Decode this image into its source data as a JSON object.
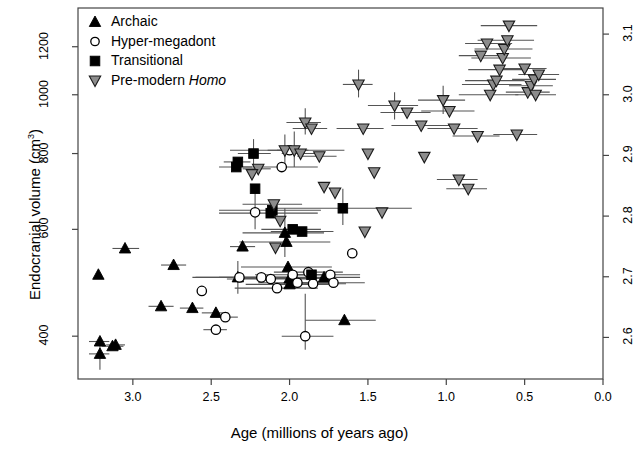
{
  "chart_data": {
    "type": "scatter",
    "title": "",
    "xlabel": "Age (millions of years ago)",
    "ylabel_left": "Endocranial volume (cm3)",
    "ylabel_left_base": "Endocranial volume (cm",
    "ylabel_left_sup": "3",
    "ylabel_left_close": ")",
    "ylabel_right": "",
    "xlim": [
      3.35,
      0.0
    ],
    "xlim_reversed": true,
    "ylim_left": [
      340,
      1390
    ],
    "y_scale": "log10",
    "grid": false,
    "legend_position": "top-left",
    "xticks": [
      "3.0",
      "2.5",
      "2.0",
      "1.5",
      "1.0",
      "0.5",
      "0.0"
    ],
    "xtick_values": [
      3.0,
      2.5,
      2.0,
      1.5,
      1.0,
      0.5,
      0.0
    ],
    "yticks_left": [
      "400",
      "600",
      "800",
      "1000",
      "1200"
    ],
    "ytick_values_left": [
      400,
      600,
      800,
      1000,
      1200
    ],
    "yticks_right": [
      "2.6",
      "2.7",
      "2.8",
      "2.9",
      "3.0",
      "3.1"
    ],
    "ytick_values_right": [
      2.6,
      2.7,
      2.8,
      2.9,
      3.0,
      3.1
    ],
    "series": [
      {
        "name": "Archaic",
        "marker": "triangle-up",
        "fill": "#000000",
        "stroke": "#000000",
        "points": [
          {
            "x": 3.21,
            "y": 374,
            "xerr": [
              3.28,
              3.15
            ],
            "yerr": [
              352,
              398
            ]
          },
          {
            "x": 3.21,
            "y": 392,
            "xerr": [
              3.28,
              3.15
            ],
            "yerr": null
          },
          {
            "x": 3.13,
            "y": 385,
            "xerr": [
              3.2,
              3.06
            ],
            "yerr": null
          },
          {
            "x": 3.11,
            "y": 387,
            "xerr": [
              3.17,
              3.05
            ],
            "yerr": null
          },
          {
            "x": 3.22,
            "y": 505,
            "xerr": null,
            "yerr": null
          },
          {
            "x": 3.05,
            "y": 558,
            "xerr": [
              3.13,
              2.96
            ],
            "yerr": null
          },
          {
            "x": 2.82,
            "y": 448,
            "xerr": [
              2.9,
              2.74
            ],
            "yerr": null
          },
          {
            "x": 2.74,
            "y": 524,
            "xerr": [
              2.82,
              2.66
            ],
            "yerr": null
          },
          {
            "x": 2.62,
            "y": 445,
            "xerr": [
              2.7,
              2.55
            ],
            "yerr": null
          },
          {
            "x": 2.47,
            "y": 437,
            "xerr": [
              2.56,
              2.39
            ],
            "yerr": null
          },
          {
            "x": 2.33,
            "y": 500,
            "xerr": [
              2.62,
              2.05
            ],
            "yerr": [
              470,
              532
            ]
          },
          {
            "x": 2.3,
            "y": 562,
            "xerr": [
              2.38,
              2.22
            ],
            "yerr": null
          },
          {
            "x": 2.03,
            "y": 592,
            "xerr": [
              2.3,
              1.78
            ],
            "yerr": [
              540,
              650
            ]
          },
          {
            "x": 2.02,
            "y": 572,
            "xerr": [
              2.32,
              1.74
            ],
            "yerr": null
          },
          {
            "x": 2.01,
            "y": 520,
            "xerr": [
              2.31,
              1.73
            ],
            "yerr": null
          },
          {
            "x": 2.0,
            "y": 498,
            "xerr": [
              2.3,
              1.72
            ],
            "yerr": null
          },
          {
            "x": 2.0,
            "y": 487,
            "xerr": [
              2.28,
              1.75
            ],
            "yerr": null
          },
          {
            "x": 1.78,
            "y": 500,
            "xerr": [
              2.05,
              1.55
            ],
            "yerr": null
          },
          {
            "x": 1.65,
            "y": 425,
            "xerr": [
              1.9,
              1.45
            ],
            "yerr": null
          }
        ]
      },
      {
        "name": "Hyper-megadont",
        "marker": "circle-open",
        "fill": "#ffffff",
        "stroke": "#000000",
        "points": [
          {
            "x": 2.56,
            "y": 475,
            "xerr": null,
            "yerr": null
          },
          {
            "x": 2.47,
            "y": 410,
            "xerr": [
              2.55,
              2.4
            ],
            "yerr": null
          },
          {
            "x": 2.41,
            "y": 430,
            "xerr": [
              2.5,
              2.33
            ],
            "yerr": null
          },
          {
            "x": 2.0,
            "y": 810,
            "xerr": [
              2.38,
              1.65
            ],
            "yerr": null
          },
          {
            "x": 2.05,
            "y": 760,
            "xerr": [
              2.3,
              1.82
            ],
            "yerr": null
          },
          {
            "x": 2.22,
            "y": 640,
            "xerr": null,
            "yerr": [
              600,
              690
            ]
          },
          {
            "x": 2.18,
            "y": 500,
            "xerr": [
              2.45,
              1.95
            ],
            "yerr": null
          },
          {
            "x": 2.12,
            "y": 497,
            "xerr": [
              2.4,
              1.86
            ],
            "yerr": null
          },
          {
            "x": 2.08,
            "y": 480,
            "xerr": [
              2.35,
              1.82
            ],
            "yerr": null
          },
          {
            "x": 1.98,
            "y": 505,
            "xerr": [
              2.22,
              1.76
            ],
            "yerr": null
          },
          {
            "x": 1.95,
            "y": 490,
            "xerr": [
              2.2,
              1.72
            ],
            "yerr": null
          },
          {
            "x": 1.88,
            "y": 510,
            "xerr": [
              2.1,
              1.66
            ],
            "yerr": null
          },
          {
            "x": 1.85,
            "y": 488,
            "xerr": [
              2.08,
              1.64
            ],
            "yerr": null
          },
          {
            "x": 1.74,
            "y": 505,
            "xerr": [
              1.95,
              1.55
            ],
            "yerr": null
          },
          {
            "x": 1.72,
            "y": 490,
            "xerr": [
              1.92,
              1.52
            ],
            "yerr": null
          },
          {
            "x": 1.9,
            "y": 400,
            "xerr": [
              2.05,
              1.72
            ],
            "yerr": [
              380,
              470
            ]
          },
          {
            "x": 1.6,
            "y": 548,
            "xerr": null,
            "yerr": null
          },
          {
            "x": 2.32,
            "y": 500,
            "xerr": [
              2.6,
              2.02
            ],
            "yerr": null
          }
        ]
      },
      {
        "name": "Transitional",
        "marker": "square-filled",
        "fill": "#000000",
        "stroke": "#000000",
        "points": [
          {
            "x": 2.33,
            "y": 775,
            "xerr": [
              2.42,
              2.25
            ],
            "yerr": null
          },
          {
            "x": 2.34,
            "y": 760,
            "xerr": [
              2.45,
              2.24
            ],
            "yerr": null
          },
          {
            "x": 2.23,
            "y": 800,
            "xerr": [
              2.33,
              2.12
            ],
            "yerr": [
              760,
              845
            ]
          },
          {
            "x": 2.22,
            "y": 700,
            "xerr": null,
            "yerr": null
          },
          {
            "x": 2.11,
            "y": 645,
            "xerr": [
              2.45,
              1.8
            ],
            "yerr": null
          },
          {
            "x": 2.12,
            "y": 638,
            "xerr": [
              2.45,
              1.82
            ],
            "yerr": null
          },
          {
            "x": 1.98,
            "y": 600,
            "xerr": [
              2.18,
              1.8
            ],
            "yerr": null
          },
          {
            "x": 1.92,
            "y": 595,
            "xerr": [
              2.12,
              1.72
            ],
            "yerr": null
          },
          {
            "x": 1.66,
            "y": 650,
            "xerr": [
              2.1,
              1.22
            ],
            "yerr": [
              610,
              700
            ]
          },
          {
            "x": 1.86,
            "y": 505,
            "xerr": [
              1.98,
              1.74
            ],
            "yerr": null
          }
        ]
      },
      {
        "name": "Pre-modern Homo",
        "marker": "triangle-down",
        "fill": "#8c8c8c",
        "stroke": "#1a1a1a",
        "points": [
          {
            "x": 2.2,
            "y": 755,
            "xerr": [
              2.3,
              2.12
            ],
            "yerr": null
          },
          {
            "x": 2.24,
            "y": 740,
            "xerr": null,
            "yerr": null
          },
          {
            "x": 2.1,
            "y": 660,
            "xerr": [
              2.3,
              1.92
            ],
            "yerr": null
          },
          {
            "x": 2.06,
            "y": 620,
            "xerr": null,
            "yerr": null
          },
          {
            "x": 2.09,
            "y": 560,
            "xerr": null,
            "yerr": null
          },
          {
            "x": 2.03,
            "y": 810,
            "xerr": [
              2.14,
              1.94
            ],
            "yerr": [
              770,
              860
            ]
          },
          {
            "x": 1.97,
            "y": 810,
            "xerr": [
              2.08,
              1.88
            ],
            "yerr": [
              760,
              870
            ]
          },
          {
            "x": 1.93,
            "y": 800,
            "xerr": [
              2.05,
              1.84
            ],
            "yerr": null
          },
          {
            "x": 1.9,
            "y": 900,
            "xerr": [
              2.02,
              1.8
            ],
            "yerr": [
              860,
              950
            ]
          },
          {
            "x": 1.86,
            "y": 880,
            "xerr": [
              1.98,
              1.76
            ],
            "yerr": null
          },
          {
            "x": 1.81,
            "y": 792,
            "xerr": [
              1.95,
              1.7
            ],
            "yerr": null
          },
          {
            "x": 1.78,
            "y": 705,
            "xerr": null,
            "yerr": null
          },
          {
            "x": 1.71,
            "y": 690,
            "xerr": null,
            "yerr": null
          },
          {
            "x": 1.56,
            "y": 1040,
            "xerr": [
              1.66,
              1.47
            ],
            "yerr": [
              990,
              1100
            ]
          },
          {
            "x": 1.53,
            "y": 880,
            "xerr": [
              1.7,
              1.4
            ],
            "yerr": null
          },
          {
            "x": 1.5,
            "y": 800,
            "xerr": null,
            "yerr": null
          },
          {
            "x": 1.46,
            "y": 745,
            "xerr": null,
            "yerr": null
          },
          {
            "x": 1.33,
            "y": 960,
            "xerr": [
              1.5,
              1.18
            ],
            "yerr": [
              910,
              1010
            ]
          },
          {
            "x": 1.25,
            "y": 935,
            "xerr": [
              1.42,
              1.1
            ],
            "yerr": null
          },
          {
            "x": 1.16,
            "y": 890,
            "xerr": [
              1.35,
              0.98
            ],
            "yerr": null
          },
          {
            "x": 1.14,
            "y": 790,
            "xerr": null,
            "yerr": null
          },
          {
            "x": 1.02,
            "y": 980,
            "xerr": [
              1.18,
              0.88
            ],
            "yerr": [
              930,
              1035
            ]
          },
          {
            "x": 0.98,
            "y": 940,
            "xerr": [
              1.16,
              0.82
            ],
            "yerr": null
          },
          {
            "x": 0.95,
            "y": 880,
            "xerr": [
              1.12,
              0.8
            ],
            "yerr": null
          },
          {
            "x": 0.92,
            "y": 725,
            "xerr": [
              1.06,
              0.8
            ],
            "yerr": null
          },
          {
            "x": 0.86,
            "y": 700,
            "xerr": [
              1.0,
              0.74
            ],
            "yerr": null
          },
          {
            "x": 0.8,
            "y": 855,
            "xerr": [
              0.96,
              0.66
            ],
            "yerr": null
          },
          {
            "x": 0.72,
            "y": 1000,
            "xerr": [
              0.92,
              0.54
            ],
            "yerr": null
          },
          {
            "x": 0.7,
            "y": 1040,
            "xerr": [
              0.9,
              0.52
            ],
            "yerr": null
          },
          {
            "x": 0.68,
            "y": 1055,
            "xerr": [
              0.88,
              0.5
            ],
            "yerr": null
          },
          {
            "x": 0.66,
            "y": 1100,
            "xerr": [
              0.86,
              0.48
            ],
            "yerr": null
          },
          {
            "x": 0.64,
            "y": 1150,
            "xerr": [
              0.84,
              0.46
            ],
            "yerr": null
          },
          {
            "x": 0.63,
            "y": 1190,
            "xerr": [
              0.82,
              0.45
            ],
            "yerr": null
          },
          {
            "x": 0.61,
            "y": 1230,
            "xerr": [
              0.8,
              0.44
            ],
            "yerr": null
          },
          {
            "x": 0.6,
            "y": 1300,
            "xerr": [
              0.78,
              0.42
            ],
            "yerr": null
          },
          {
            "x": 0.74,
            "y": 1215,
            "xerr": [
              0.88,
              0.58
            ],
            "yerr": null
          },
          {
            "x": 0.78,
            "y": 1160,
            "xerr": [
              0.92,
              0.62
            ],
            "yerr": null
          },
          {
            "x": 0.5,
            "y": 1105,
            "xerr": [
              0.66,
              0.36
            ],
            "yerr": null
          },
          {
            "x": 0.48,
            "y": 1010,
            "xerr": [
              0.62,
              0.34
            ],
            "yerr": null
          },
          {
            "x": 0.46,
            "y": 1035,
            "xerr": [
              0.6,
              0.32
            ],
            "yerr": null
          },
          {
            "x": 0.44,
            "y": 1060,
            "xerr": [
              0.58,
              0.3
            ],
            "yerr": null
          },
          {
            "x": 0.43,
            "y": 1000,
            "xerr": [
              0.56,
              0.3
            ],
            "yerr": null
          },
          {
            "x": 0.41,
            "y": 1080,
            "xerr": [
              0.54,
              0.28
            ],
            "yerr": null
          },
          {
            "x": 1.41,
            "y": 640,
            "xerr": null,
            "yerr": null
          },
          {
            "x": 1.52,
            "y": 595,
            "xerr": null,
            "yerr": null
          },
          {
            "x": 0.55,
            "y": 860,
            "xerr": [
              0.7,
              0.42
            ],
            "yerr": null
          }
        ]
      }
    ],
    "legend": [
      {
        "label": "Archaic",
        "marker": "triangle-up",
        "fill": "#000000"
      },
      {
        "label": "Hyper-megadont",
        "marker": "circle-open",
        "fill": "#ffffff"
      },
      {
        "label": "Transitional",
        "marker": "square-filled",
        "fill": "#000000"
      },
      {
        "label": "Pre-modern Homo",
        "marker": "triangle-down",
        "fill": "#8c8c8c",
        "italic_part": "Homo",
        "plain_part": "Pre-modern "
      }
    ]
  },
  "axes": {
    "frame_color": "#444444",
    "tick_color": "#444444",
    "error_bar_color": "#555555"
  }
}
